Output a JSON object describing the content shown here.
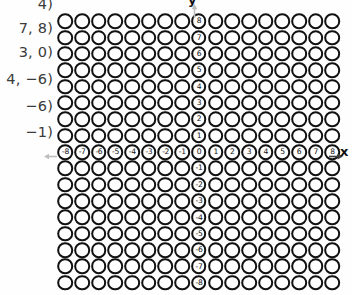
{
  "coord_list": {
    "lines": [
      {
        "text": "4)",
        "top": -4
      },
      {
        "text": "7, 8)",
        "top": 20
      },
      {
        "text": "3, 0)",
        "top": 44
      },
      {
        "text": "4, −6)",
        "top": 71
      },
      {
        "text": "−6)",
        "top": 98
      },
      {
        "text": "−1)",
        "top": 124
      }
    ]
  },
  "axes": {
    "x_label": "x",
    "y_label": "y",
    "x_arrow_left": "left-arrow-icon",
    "x_arrow_right": "right-arrow-icon",
    "y_arrow_up": "up-arrow-icon",
    "x_ticks": [
      "-8",
      "-7",
      "-6",
      "-5",
      "-4",
      "-3",
      "-2",
      "-1",
      "0",
      "1",
      "2",
      "3",
      "4",
      "5",
      "6",
      "7",
      "8"
    ],
    "y_ticks": [
      "8",
      "7",
      "6",
      "5",
      "4",
      "3",
      "2",
      "1",
      "0",
      "-1",
      "-2",
      "-3",
      "-4",
      "-5",
      "-6",
      "-7",
      "-8"
    ],
    "origin_label": "0",
    "arrow_color": "#b8b8b8",
    "ink_color": "#111111"
  },
  "chart_data": {
    "type": "scatter",
    "title": "",
    "xlabel": "x",
    "ylabel": "y",
    "xlim": [
      -8,
      8
    ],
    "ylim": [
      -8,
      8
    ],
    "grid": true,
    "marker": "open-circle",
    "columns": 17,
    "rows": 17,
    "x": [
      -8,
      -7,
      -6,
      -5,
      -4,
      -3,
      -2,
      -1,
      0,
      1,
      2,
      3,
      4,
      5,
      6,
      7,
      8
    ],
    "y": [
      8,
      7,
      6,
      5,
      4,
      3,
      2,
      1,
      0,
      -1,
      -2,
      -3,
      -4,
      -5,
      -6,
      -7,
      -8
    ],
    "series": [
      {
        "name": "grid-circles",
        "description": "17 by 17 lattice of open circles covering every integer coordinate from -8 to 8 on both axes"
      }
    ]
  }
}
